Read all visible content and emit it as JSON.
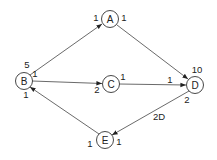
{
  "diagram": {
    "type": "directed-graph",
    "nodes": [
      {
        "id": "A",
        "label": "A",
        "x": 110,
        "y": 19
      },
      {
        "id": "B",
        "label": "B",
        "x": 24,
        "y": 81
      },
      {
        "id": "C",
        "label": "C",
        "x": 111,
        "y": 84
      },
      {
        "id": "D",
        "label": "D",
        "x": 195,
        "y": 85
      },
      {
        "id": "E",
        "label": "E",
        "x": 105,
        "y": 140
      }
    ],
    "edges": [
      {
        "from": "B",
        "to": "A"
      },
      {
        "from": "A",
        "to": "D"
      },
      {
        "from": "B",
        "to": "C"
      },
      {
        "from": "C",
        "to": "D"
      },
      {
        "from": "D",
        "to": "E",
        "label": "2D"
      },
      {
        "from": "E",
        "to": "B"
      }
    ],
    "port_labels": [
      {
        "text": "1",
        "x": 96,
        "y": 17
      },
      {
        "text": "1",
        "x": 124,
        "y": 17
      },
      {
        "text": "5",
        "x": 27,
        "y": 64
      },
      {
        "text": "1",
        "x": 35,
        "y": 73
      },
      {
        "text": "1",
        "x": 26,
        "y": 94
      },
      {
        "text": "2",
        "x": 97,
        "y": 89
      },
      {
        "text": "1",
        "x": 123,
        "y": 76
      },
      {
        "text": "10",
        "x": 197,
        "y": 69
      },
      {
        "text": "1",
        "x": 170,
        "y": 79
      },
      {
        "text": "2",
        "x": 187,
        "y": 99
      },
      {
        "text": "2D",
        "x": 159,
        "y": 116
      },
      {
        "text": "1",
        "x": 90,
        "y": 143
      },
      {
        "text": "1",
        "x": 119,
        "y": 141
      }
    ]
  }
}
